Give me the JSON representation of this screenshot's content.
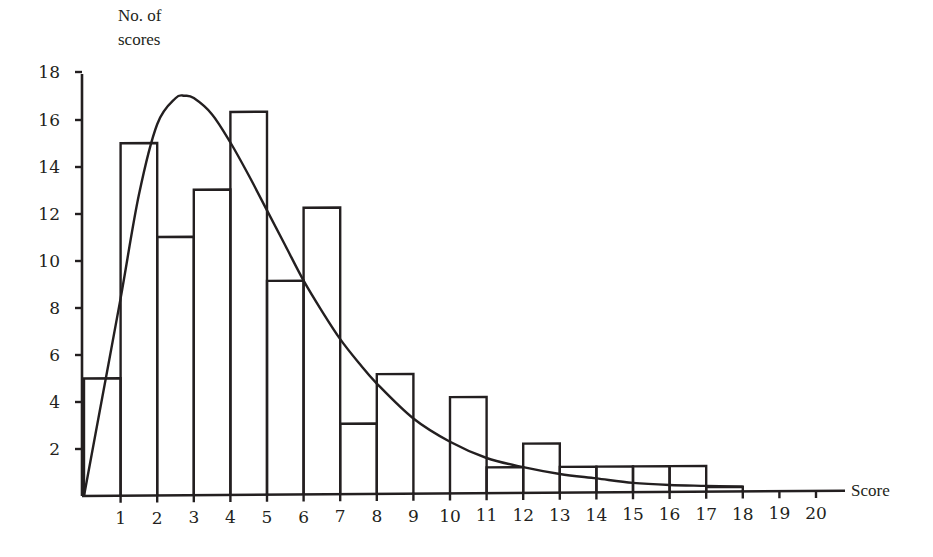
{
  "chart_data": {
    "type": "bar",
    "subtype": "histogram-with-fitted-curve",
    "title": "",
    "xlabel": "Score",
    "ylabel": "No. of scores",
    "ylabel_lines": [
      "No. of",
      "scores"
    ],
    "x_ticks": [
      1,
      2,
      3,
      4,
      5,
      6,
      7,
      8,
      9,
      10,
      11,
      12,
      13,
      14,
      15,
      16,
      17,
      18,
      19,
      20
    ],
    "y_ticks": [
      2,
      4,
      6,
      8,
      10,
      12,
      14,
      16,
      18
    ],
    "xlim": [
      0,
      20.5
    ],
    "ylim": [
      0,
      18
    ],
    "grid": false,
    "legend": null,
    "bins": [
      {
        "from": 0,
        "to": 1,
        "count": 5
      },
      {
        "from": 1,
        "to": 2,
        "count": 15
      },
      {
        "from": 2,
        "to": 3,
        "count": 11
      },
      {
        "from": 3,
        "to": 4,
        "count": 13
      },
      {
        "from": 4,
        "to": 5,
        "count": 16.3
      },
      {
        "from": 5,
        "to": 6,
        "count": 9.1
      },
      {
        "from": 6,
        "to": 7,
        "count": 12.2
      },
      {
        "from": 7,
        "to": 8,
        "count": 3
      },
      {
        "from": 8,
        "to": 9,
        "count": 5.1
      },
      {
        "from": 9,
        "to": 10,
        "count": 0
      },
      {
        "from": 10,
        "to": 11,
        "count": 4.1
      },
      {
        "from": 11,
        "to": 12,
        "count": 1.1
      },
      {
        "from": 12,
        "to": 13,
        "count": 2.1
      },
      {
        "from": 13,
        "to": 14,
        "count": 1.1
      },
      {
        "from": 14,
        "to": 15,
        "count": 1.1
      },
      {
        "from": 15,
        "to": 16,
        "count": 1.1
      },
      {
        "from": 16,
        "to": 17,
        "count": 1.1
      },
      {
        "from": 17,
        "to": 18,
        "count": 0.2
      }
    ],
    "series": [
      {
        "name": "fitted distribution curve",
        "type": "line",
        "x": [
          0,
          0.5,
          1,
          1.5,
          2,
          2.5,
          2.75,
          3,
          3.5,
          4,
          4.5,
          5,
          5.5,
          6,
          6.5,
          7,
          7.5,
          8,
          9,
          10,
          11,
          12,
          13,
          14,
          15,
          16,
          17,
          18
        ],
        "y": [
          0,
          4.2,
          8.4,
          12.8,
          15.8,
          16.9,
          17.0,
          16.9,
          16.2,
          15.0,
          13.6,
          12.1,
          10.6,
          9.1,
          7.8,
          6.6,
          5.6,
          4.7,
          3.2,
          2.2,
          1.5,
          1.1,
          0.8,
          0.6,
          0.4,
          0.3,
          0.25,
          0.2
        ]
      }
    ]
  }
}
